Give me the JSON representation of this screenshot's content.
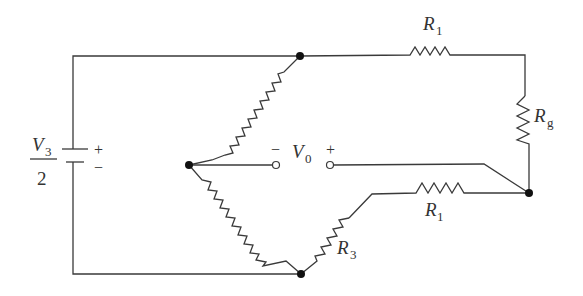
{
  "diagram": {
    "type": "circuit-schematic",
    "source": {
      "label_numerator": "V",
      "label_numerator_sub": "3",
      "label_denominator": "2",
      "plus_sign": "+",
      "minus_sign": "−"
    },
    "output": {
      "label": "V",
      "label_sub": "0",
      "minus_sign": "−",
      "plus_sign": "+"
    },
    "resistors": [
      {
        "id": "R1-top",
        "label": "R",
        "sub": "1"
      },
      {
        "id": "Rg",
        "label": "R",
        "sub": "g"
      },
      {
        "id": "R1-bottom",
        "label": "R",
        "sub": "1"
      },
      {
        "id": "R3",
        "label": "R",
        "sub": "3"
      },
      {
        "id": "bridge-upper-left",
        "label": "",
        "sub": ""
      },
      {
        "id": "bridge-lower-left",
        "label": "",
        "sub": ""
      }
    ],
    "colors": {
      "wire": "#3a3a3a",
      "node": "#111111",
      "background": "#ffffff"
    }
  }
}
